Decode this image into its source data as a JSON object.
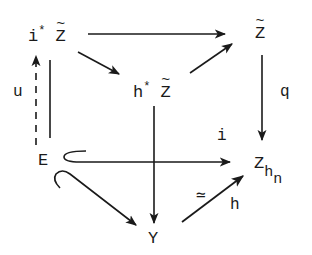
{
  "diagram": {
    "type": "commutative-diagram",
    "nodes": {
      "i_star_z_tilde": {
        "prefix": "i",
        "sup": "*",
        "base": "Z",
        "accent": "~"
      },
      "z_tilde": {
        "base": "Z",
        "accent": "~"
      },
      "h_star_z_tilde": {
        "prefix": "h",
        "sup": "*",
        "base": "Z",
        "accent": "~"
      },
      "e": {
        "base": "E"
      },
      "z_hn": {
        "base": "Z",
        "sub": "h",
        "subsub": "n"
      },
      "y": {
        "base": "Y"
      }
    },
    "labels": {
      "u": "u",
      "q": "q",
      "i": "i",
      "h": "h",
      "equiv": "≃"
    },
    "edges": [
      {
        "from": "i*Z~",
        "to": "Z~",
        "style": "solid",
        "label": ""
      },
      {
        "from": "i*Z~",
        "to": "h*Z~",
        "style": "solid",
        "label": ""
      },
      {
        "from": "h*Z~",
        "to": "Z~",
        "style": "solid",
        "label": ""
      },
      {
        "from": "Z~",
        "to": "Z_h_n",
        "style": "solid",
        "label": "q"
      },
      {
        "from": "h*Z~",
        "to": "Y",
        "style": "solid",
        "label": ""
      },
      {
        "from": "E",
        "to": "i*Z~",
        "style": "dashed",
        "label": "u"
      },
      {
        "from": "E",
        "to": "i*Z~",
        "style": "solid-line",
        "label": ""
      },
      {
        "from": "E",
        "to": "Z_h_n",
        "style": "hook-inclusion",
        "label": "i"
      },
      {
        "from": "E",
        "to": "Y",
        "style": "hook-inclusion",
        "label": ""
      },
      {
        "from": "Y",
        "to": "Z_h_n",
        "style": "solid",
        "label": "h ≃"
      }
    ]
  },
  "colors": {
    "ink": "#1a1a1a",
    "background": "#ffffff"
  }
}
